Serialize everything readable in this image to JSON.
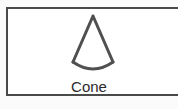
{
  "shape": {
    "name": "Cone",
    "icon": "cone-icon",
    "stroke_color": "#505050"
  }
}
